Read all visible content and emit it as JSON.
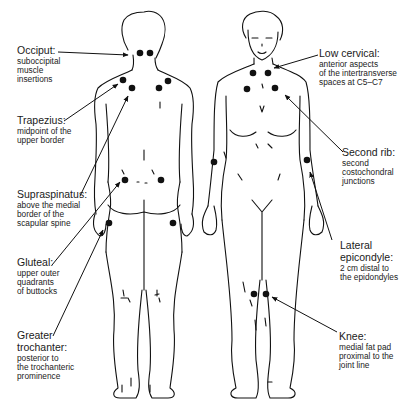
{
  "figure": {
    "views": [
      "posterior",
      "anterior"
    ],
    "marker_color": "#111111",
    "line_color": "#111111"
  },
  "labels": {
    "occiput": {
      "title": "Occiput:",
      "desc": [
        "suboccipital",
        "muscle",
        "insertions"
      ]
    },
    "trapezius": {
      "title": "Trapezius:",
      "desc": [
        "midpoint of the",
        "upper border"
      ]
    },
    "supraspinatus": {
      "title": "Supraspinatus:",
      "desc": [
        "above the medial",
        "border of the",
        "scapular spine"
      ]
    },
    "gluteal": {
      "title": "Gluteal:",
      "desc": [
        "upper outer",
        "quadrants",
        "of buttocks"
      ]
    },
    "greater_trochanter": {
      "title": [
        "Greater",
        "trochanter:"
      ],
      "desc": [
        "posterior to",
        "the trochanteric",
        "prominence"
      ]
    },
    "low_cervical": {
      "title": "Low cervical:",
      "desc": [
        "anterior aspects",
        "of the intertransverse",
        "spaces at C5–C7"
      ]
    },
    "second_rib": {
      "title": "Second rib:",
      "desc": [
        "second",
        "costochondral",
        "junctions"
      ]
    },
    "lateral_epicondyle": {
      "title": [
        "Lateral",
        "epicondyle:"
      ],
      "desc": [
        "2 cm distal to",
        "the epidondyles"
      ]
    },
    "knee": {
      "title": "Knee:",
      "desc": [
        "medial fat pad",
        "proximal to the",
        "joint line"
      ]
    }
  }
}
